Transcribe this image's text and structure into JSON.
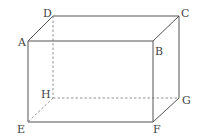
{
  "figure": {
    "type": "rectangular-cuboid",
    "stroke_color": "#555555",
    "hidden_edge_style": "dashed",
    "vertices": {
      "A": {
        "label": "A",
        "x": 28,
        "y": 41,
        "lx": 18,
        "ly": 46
      },
      "B": {
        "label": "B",
        "x": 153,
        "y": 41,
        "lx": 155,
        "ly": 55
      },
      "C": {
        "label": "C",
        "x": 179,
        "y": 16,
        "lx": 181,
        "ly": 17
      },
      "D": {
        "label": "D",
        "x": 53,
        "y": 16,
        "lx": 43,
        "ly": 17
      },
      "E": {
        "label": "E",
        "x": 28,
        "y": 122,
        "lx": 17,
        "ly": 133
      },
      "F": {
        "label": "F",
        "x": 153,
        "y": 122,
        "lx": 153,
        "ly": 133
      },
      "G": {
        "label": "G",
        "x": 179,
        "y": 98,
        "lx": 182,
        "ly": 104
      },
      "H": {
        "label": "H",
        "x": 53,
        "y": 98,
        "lx": 41,
        "ly": 98
      }
    },
    "visible_edges": [
      [
        "A",
        "B"
      ],
      [
        "B",
        "C"
      ],
      [
        "C",
        "D"
      ],
      [
        "D",
        "A"
      ],
      [
        "A",
        "E"
      ],
      [
        "B",
        "F"
      ],
      [
        "C",
        "G"
      ],
      [
        "E",
        "F"
      ],
      [
        "F",
        "G"
      ]
    ],
    "hidden_edges": [
      [
        "D",
        "H"
      ],
      [
        "H",
        "E"
      ],
      [
        "H",
        "G"
      ]
    ]
  }
}
